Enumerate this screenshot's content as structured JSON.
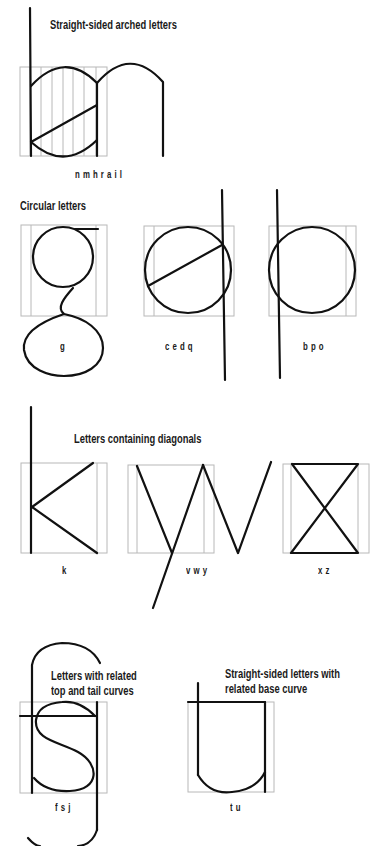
{
  "sections": {
    "arched": {
      "title": "Straight-sided arched letters",
      "letters": "nmhrail"
    },
    "circular": {
      "title": "Circular letters",
      "groups": [
        {
          "letters": "g"
        },
        {
          "letters": "cedq"
        },
        {
          "letters": "bpo"
        }
      ]
    },
    "diagonal": {
      "title": "Letters containing diagonals",
      "groups": [
        {
          "letters": "k"
        },
        {
          "letters": "vwy"
        },
        {
          "letters": "xz"
        }
      ]
    },
    "tail_curves": {
      "title_line1": "Letters with related",
      "title_line2": "top and tail curves",
      "letters": "fsj"
    },
    "base_curve": {
      "title_line1": "Straight-sided letters with",
      "title_line2": "related base curve",
      "letters": "tu"
    }
  },
  "colors": {
    "stroke": "#111111",
    "grid": "#b8b8b8",
    "background": "#ffffff"
  }
}
